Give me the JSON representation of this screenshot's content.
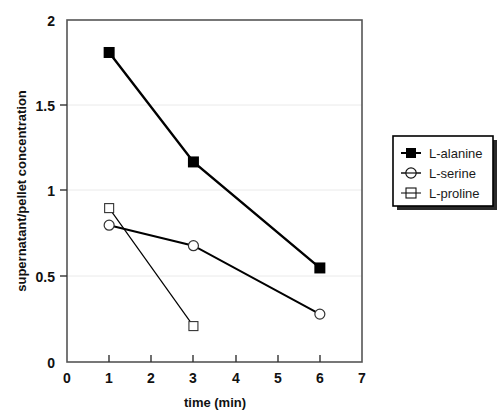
{
  "chart_data": {
    "type": "line",
    "title": "",
    "xlabel": "time (min)",
    "ylabel": "supernatant/pellet concentration",
    "xlim": [
      0,
      7
    ],
    "ylim": [
      0,
      2
    ],
    "xticks": [
      "0",
      "1",
      "2",
      "3",
      "4",
      "5",
      "6",
      "7"
    ],
    "xtick_values": [
      0,
      1,
      2,
      3,
      4,
      5,
      6,
      7
    ],
    "yticks": [
      "0",
      "0.5",
      "1",
      "1.5",
      "2"
    ],
    "ytick_values": [
      0,
      0.5,
      1,
      1.5,
      2
    ],
    "grid": "horizontal",
    "legend_position": "right-outside",
    "series": [
      {
        "name": "L-alanine",
        "marker": "filled-square",
        "color": "#000000",
        "line_width": 2.4,
        "x": [
          1,
          3,
          6
        ],
        "values": [
          1.81,
          1.17,
          0.55
        ]
      },
      {
        "name": "L-serine",
        "marker": "open-circle",
        "color": "#000000",
        "line_width": 2.0,
        "x": [
          1,
          3,
          6
        ],
        "values": [
          0.8,
          0.68,
          0.28
        ]
      },
      {
        "name": "L-proline",
        "marker": "open-square",
        "color": "#000000",
        "line_width": 1.2,
        "x": [
          1,
          3
        ],
        "values": [
          0.9,
          0.21
        ]
      }
    ]
  },
  "legend": {
    "entries": [
      {
        "label": "L-alanine",
        "marker": "filled-square"
      },
      {
        "label": "L-serine",
        "marker": "open-circle"
      },
      {
        "label": "L-proline",
        "marker": "open-square"
      }
    ]
  },
  "colors": {
    "plot_border": "#555555",
    "gridline": "#e8e8e8",
    "ink": "#111111",
    "background": "#ffffff",
    "legend_border": "#000000",
    "legend_shadow": "#222222"
  }
}
